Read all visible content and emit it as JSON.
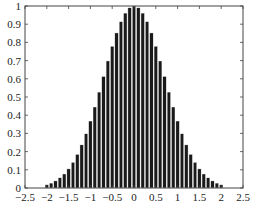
{
  "chart_data": {
    "type": "bar",
    "title": "",
    "xlabel": "",
    "ylabel": "",
    "xlim": [
      -2.5,
      2.5
    ],
    "ylim": [
      0,
      1
    ],
    "grid": false,
    "legend": null,
    "bar_color": "#1a1a1a",
    "edge_color": "#ffffff",
    "bar_width": 0.08,
    "xticks": [
      -2.5,
      -2,
      -1.5,
      -1,
      -0.5,
      0,
      0.5,
      1,
      1.5,
      2,
      2.5
    ],
    "xtick_labels": [
      "-2.5",
      "-2",
      "-1.5",
      "-1",
      "-0.5",
      "0",
      "0.5",
      "1",
      "1.5",
      "2",
      "2.5"
    ],
    "yticks": [
      0,
      0.1,
      0.2,
      0.3,
      0.4,
      0.5,
      0.6,
      0.7,
      0.8,
      0.9,
      1
    ],
    "ytick_labels": [
      "0",
      "0.1",
      "0.2",
      "0.3",
      "0.4",
      "0.5",
      "0.6",
      "0.7",
      "0.8",
      "0.9",
      "1"
    ],
    "x": [
      -2.0,
      -1.9,
      -1.8,
      -1.7,
      -1.6,
      -1.5,
      -1.4,
      -1.3,
      -1.2,
      -1.1,
      -1.0,
      -0.9,
      -0.8,
      -0.7,
      -0.6,
      -0.5,
      -0.4,
      -0.3,
      -0.2,
      -0.1,
      0.0,
      0.1,
      0.2,
      0.3,
      0.4,
      0.5,
      0.6,
      0.7,
      0.8,
      0.9,
      1.0,
      1.1,
      1.2,
      1.3,
      1.4,
      1.5,
      1.6,
      1.7,
      1.8,
      1.9,
      2.0
    ],
    "values": [
      0.018,
      0.027,
      0.039,
      0.056,
      0.077,
      0.105,
      0.141,
      0.185,
      0.237,
      0.298,
      0.368,
      0.445,
      0.527,
      0.613,
      0.698,
      0.779,
      0.852,
      0.914,
      0.961,
      0.99,
      1.0,
      0.99,
      0.961,
      0.914,
      0.852,
      0.779,
      0.698,
      0.613,
      0.527,
      0.445,
      0.368,
      0.298,
      0.237,
      0.185,
      0.141,
      0.105,
      0.077,
      0.056,
      0.039,
      0.027,
      0.018
    ]
  }
}
